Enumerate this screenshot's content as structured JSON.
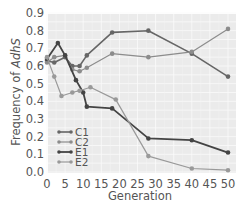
{
  "chart_data": {
    "type": "line",
    "title": "",
    "xlabel": "Generation",
    "ylabel": "Frequency of AdhS",
    "ylabel_italic_part": "AdhS",
    "ylabel_prefix": "Frequency of ",
    "xlim": [
      0,
      50
    ],
    "ylim": [
      0.0,
      0.9
    ],
    "xticks": [
      0,
      5,
      10,
      15,
      20,
      25,
      30,
      35,
      40,
      45,
      50
    ],
    "yticks": [
      "0.0",
      "0.1",
      "0.2",
      "0.3",
      "0.4",
      "0.5",
      "0.6",
      "0.7",
      "0.8",
      "0.9"
    ],
    "grid": true,
    "legend_position": "lower-left",
    "series": [
      {
        "name": "C1",
        "color": "#666666",
        "x": [
          0,
          2,
          5,
          7,
          9,
          11,
          18,
          28,
          40,
          50
        ],
        "values": [
          0.63,
          0.62,
          0.65,
          0.6,
          0.6,
          0.66,
          0.79,
          0.8,
          0.67,
          0.54
        ]
      },
      {
        "name": "C2",
        "color": "#8c8c8c",
        "x": [
          0,
          2,
          5,
          7,
          9,
          11,
          18,
          28,
          40,
          50
        ],
        "values": [
          0.62,
          0.65,
          0.66,
          0.58,
          0.57,
          0.59,
          0.67,
          0.65,
          0.68,
          0.81
        ]
      },
      {
        "name": "E1",
        "color": "#444444",
        "x": [
          0,
          3,
          5,
          8,
          10,
          11,
          18,
          28,
          40,
          50
        ],
        "values": [
          0.64,
          0.73,
          0.66,
          0.52,
          0.45,
          0.37,
          0.36,
          0.19,
          0.18,
          0.11
        ]
      },
      {
        "name": "E2",
        "color": "#999999",
        "x": [
          0,
          2,
          4,
          7,
          9,
          12,
          19,
          28,
          40,
          50
        ],
        "values": [
          0.65,
          0.54,
          0.43,
          0.45,
          0.46,
          0.48,
          0.41,
          0.09,
          0.02,
          0.01
        ]
      }
    ]
  }
}
